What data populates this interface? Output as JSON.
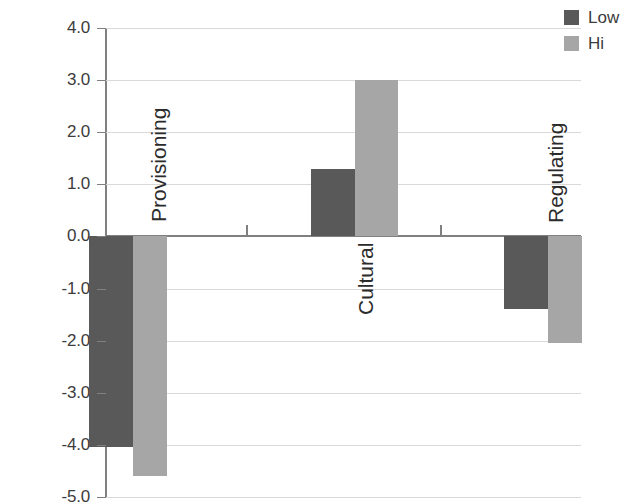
{
  "chart_data": {
    "type": "bar",
    "title": "",
    "xlabel": "",
    "ylabel": "",
    "categories": [
      "Provisioning",
      "Cultural",
      "Regulating"
    ],
    "series": [
      {
        "name": "Low",
        "color": "#595959",
        "values": [
          -4.05,
          1.3,
          -1.4
        ]
      },
      {
        "name": "Hi",
        "color": "#a6a6a6",
        "values": [
          -4.6,
          3.0,
          -2.05
        ]
      }
    ],
    "ylim": [
      -5.0,
      4.0
    ],
    "ytick_labels": [
      "4.0",
      "3.0",
      "2.0",
      "1.0",
      "0.0",
      "-1.0",
      "-2.0",
      "-3.0",
      "-4.0",
      "-5.0"
    ],
    "ytick_values": [
      4.0,
      3.0,
      2.0,
      1.0,
      0.0,
      -1.0,
      -2.0,
      -3.0,
      -4.0,
      -5.0
    ],
    "grid": true,
    "legend_position": "top-right",
    "zero_line": true,
    "orientation": "vertical",
    "bar_grouping": "grouped"
  },
  "axis": {
    "y_labels": [
      "4.0",
      "3.0",
      "2.0",
      "1.0",
      "0.0",
      "-1.0",
      "-2.0",
      "-3.0",
      "-4.0",
      "-5.0"
    ],
    "category_labels": [
      "Provisioning",
      "Cultural",
      "Regulating"
    ]
  },
  "legend": {
    "items": [
      {
        "label": "Low",
        "color": "#595959"
      },
      {
        "label": "Hi",
        "color": "#a6a6a6"
      }
    ]
  },
  "colors": {
    "low": "#595959",
    "hi": "#a6a6a6",
    "gridline": "#d9d9d9",
    "axis": "#808080",
    "text": "#3c3c3c",
    "background": "#ffffff"
  }
}
